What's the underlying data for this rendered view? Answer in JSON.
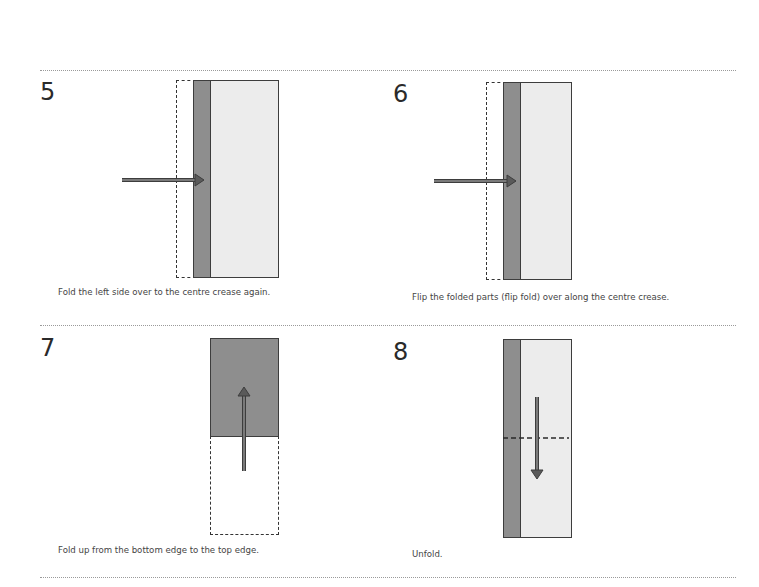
{
  "colors": {
    "fold_dark": "#8e8e8e",
    "paper_light": "#ececec",
    "outline": "#3d3d3d",
    "arrow": "#5a5a5a",
    "separator": "#9a9a9a"
  },
  "steps": [
    {
      "number": "5",
      "caption": "Fold the left side over to the centre crease again.",
      "arrow": "right-arrow"
    },
    {
      "number": "6",
      "caption": "Flip the folded parts (flip fold) over along the centre crease.",
      "arrow": "right-arrow"
    },
    {
      "number": "7",
      "caption": "Fold up from the bottom edge to the top edge.",
      "arrow": "up-arrow"
    },
    {
      "number": "8",
      "caption": "Unfold.",
      "arrow": "down-arrow"
    }
  ]
}
